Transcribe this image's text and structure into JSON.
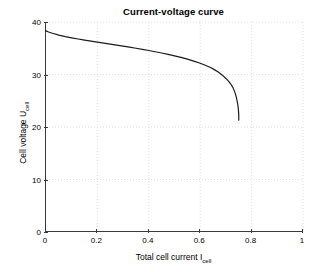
{
  "chart_data": {
    "type": "line",
    "title": "Current-voltage curve",
    "xlabel_main": "Total cell current I",
    "xlabel_sub": "cell",
    "ylabel_main": "Cell voltage U",
    "ylabel_sub": "cell",
    "xlim": [
      0,
      1
    ],
    "ylim": [
      0,
      40
    ],
    "xticks": [
      0,
      0.2,
      0.4,
      0.6,
      0.8,
      1
    ],
    "xtick_labels": [
      "0",
      "0.2",
      "0.4",
      "0.6",
      "0.8",
      "1"
    ],
    "yticks": [
      0,
      10,
      20,
      30,
      40
    ],
    "ytick_labels": [
      "0",
      "10",
      "20",
      "30",
      "40"
    ],
    "grid": true,
    "grid_style": "dotted",
    "grid_color": "#d8d8d8",
    "axis_color": "#3a3a3a",
    "line_color": "#1a1a1a",
    "line_width": 1.2,
    "legend": null,
    "series": [
      {
        "name": "Polarization curve",
        "x": [
          0.0,
          0.01,
          0.025,
          0.05,
          0.075,
          0.1,
          0.125,
          0.15,
          0.175,
          0.2,
          0.225,
          0.25,
          0.275,
          0.3,
          0.325,
          0.35,
          0.375,
          0.4,
          0.425,
          0.45,
          0.475,
          0.5,
          0.525,
          0.55,
          0.575,
          0.6,
          0.62,
          0.64,
          0.655,
          0.67,
          0.685,
          0.7,
          0.71,
          0.72,
          0.728,
          0.735,
          0.74,
          0.744,
          0.747,
          0.749,
          0.75,
          0.75,
          0.75
        ],
        "y": [
          38.3,
          38.1,
          37.85,
          37.5,
          37.22,
          36.98,
          36.76,
          36.55,
          36.35,
          36.16,
          35.97,
          35.78,
          35.59,
          35.4,
          35.2,
          35.0,
          34.79,
          34.57,
          34.34,
          34.1,
          33.84,
          33.56,
          33.26,
          32.93,
          32.56,
          32.14,
          31.76,
          31.32,
          30.93,
          30.47,
          29.92,
          29.25,
          28.74,
          28.1,
          27.45,
          26.6,
          25.8,
          24.9,
          24.0,
          23.1,
          22.4,
          21.8,
          21.3
        ]
      }
    ]
  }
}
